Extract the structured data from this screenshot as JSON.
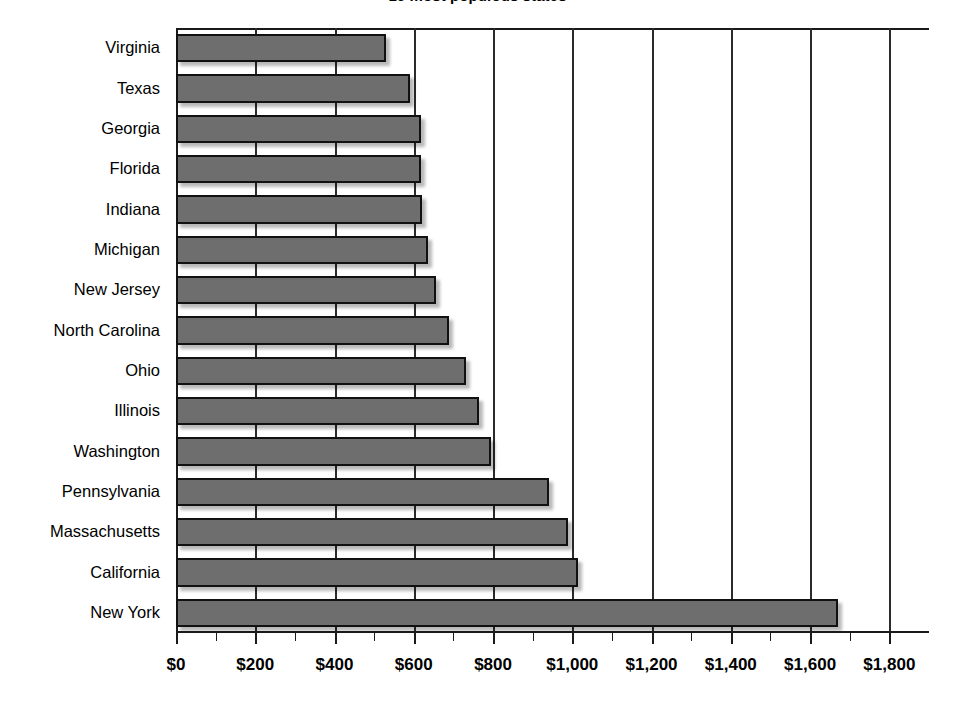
{
  "chart_data": {
    "type": "bar",
    "orientation": "horizontal",
    "title": "15 most populous states",
    "xlabel": "",
    "ylabel": "",
    "categories": [
      "Virginia",
      "Texas",
      "Georgia",
      "Florida",
      "Indiana",
      "Michigan",
      "New Jersey",
      "North Carolina",
      "Ohio",
      "Illinois",
      "Washington",
      "Pennsylvania",
      "Massachusetts",
      "California",
      "New York"
    ],
    "values": [
      530,
      590,
      617,
      618,
      620,
      637,
      655,
      690,
      733,
      765,
      795,
      940,
      990,
      1015,
      1670
    ],
    "xlim": [
      0,
      1900
    ],
    "xticks": [
      0,
      200,
      400,
      600,
      800,
      1000,
      1200,
      1400,
      1600,
      1800
    ],
    "xtick_labels": [
      "$0",
      "$200",
      "$400",
      "$600",
      "$800",
      "$1,000",
      "$1,200",
      "$1,400",
      "$1,600",
      "$1,800"
    ],
    "grid": "vertical",
    "legend": null,
    "bar_color": "#6e6e6e",
    "bar_edge_color": "#111111",
    "axis_color": "#1a1a1a",
    "background": "#ffffff"
  }
}
